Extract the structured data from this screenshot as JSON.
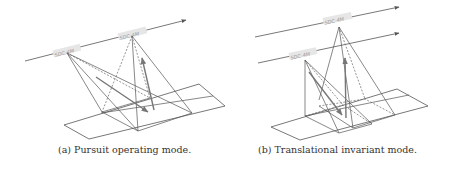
{
  "figure": {
    "panels": [
      {
        "id": "a",
        "caption": "(a) Pursuit operating mode.",
        "satellites": [
          "SDC-4M",
          "SDC-4M"
        ]
      },
      {
        "id": "b",
        "caption": "(b) Translational invariant mode.",
        "satellites": [
          "SDC-4M",
          "SDC-4M"
        ]
      }
    ],
    "colors": {
      "line": "#555555",
      "dashed": "#666666",
      "arrow": "#777777",
      "background": "#ffffff"
    }
  }
}
